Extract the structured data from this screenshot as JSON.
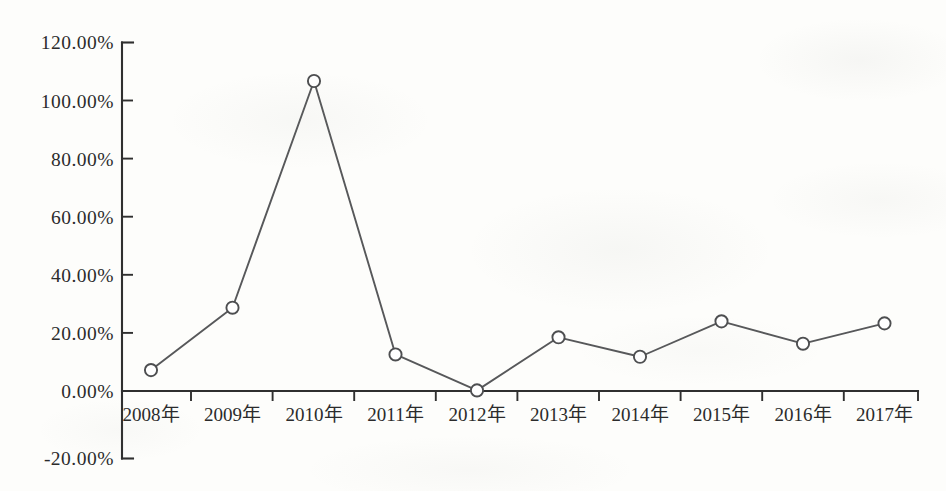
{
  "chart_data": {
    "type": "line",
    "title": "",
    "subtitle": "",
    "xlabel": "",
    "ylabel": "",
    "categories": [
      "2008年",
      "2009年",
      "2010年",
      "2011年",
      "2012年",
      "2013年",
      "2014年",
      "2015年",
      "2016年",
      "2017年"
    ],
    "values": [
      7.2,
      28.7,
      106.8,
      12.6,
      0.2,
      18.5,
      11.8,
      24.0,
      16.3,
      23.3
    ],
    "value_labels": [
      "7.20%",
      "28.70%",
      "106.80%",
      "12.60%",
      "0.20%",
      "18.50%",
      "11.80%",
      "24.00%",
      "16.30%",
      "23.30%"
    ],
    "ylim": [
      -20,
      120
    ],
    "ytick_values": [
      120,
      100,
      80,
      60,
      40,
      20,
      0,
      -20
    ],
    "ytick_labels": [
      "120.00%",
      "100.00%",
      "80.00%",
      "60.00%",
      "40.00%",
      "20.00%",
      "0.00%",
      "-20.00%"
    ],
    "grid": false,
    "legend": null,
    "legend_position": "none",
    "marker": "open-circle",
    "series_color": "#57585a",
    "axis_color": "#2f2f2f",
    "background_color": "#fdfdfb",
    "baseline_value": 0,
    "annotations": []
  },
  "axes": {
    "y_axis_name": "y-axis",
    "x_axis_name": "x-axis",
    "x_axis_note": "category axis drawn at the 0.00% level"
  }
}
